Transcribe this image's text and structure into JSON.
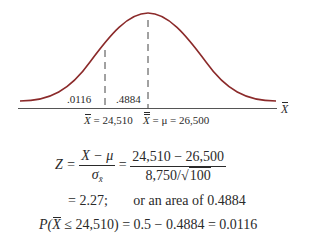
{
  "diagram": {
    "type": "normal-distribution",
    "curve_color": "#8b2a2a",
    "axis_color": "#555555",
    "axis_label": "X",
    "regions": [
      {
        "label": ".0116",
        "side": "left-tail"
      },
      {
        "label": ".4884",
        "side": "between"
      }
    ],
    "markers": [
      {
        "symbol": "X",
        "text": "= 24,510"
      },
      {
        "symbol": "X",
        "text": "= μ = 26,500"
      }
    ]
  },
  "equations": {
    "z_lhs": "Z =",
    "z_num": "X − μ",
    "z_den_sigma": "σ",
    "z_den_sub": "x̄",
    "eq2": "=",
    "val_num": "24,510 − 26,500",
    "val_den_pre": "8,750/√",
    "val_den_sqrt": "100",
    "line2_result": "= 2.27;",
    "line2_area": "or an area of 0.4884",
    "line3_p": "P(",
    "line3_x": "X",
    "line3_rest": " ≤ 24,510) = 0.5 − 0.4884 = 0.0116"
  }
}
